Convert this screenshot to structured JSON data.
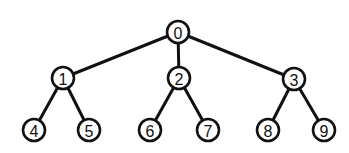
{
  "diagram": {
    "type": "tree",
    "colors": {
      "stroke": "#111111",
      "fill": "#ffffff",
      "text": "#111111"
    },
    "node_radius": 11,
    "nodes": [
      {
        "id": "0",
        "label": "0",
        "x": 178,
        "y": 32
      },
      {
        "id": "1",
        "label": "1",
        "x": 63,
        "y": 78
      },
      {
        "id": "2",
        "label": "2",
        "x": 179,
        "y": 78
      },
      {
        "id": "3",
        "label": "3",
        "x": 294,
        "y": 79
      },
      {
        "id": "4",
        "label": "4",
        "x": 34,
        "y": 130
      },
      {
        "id": "5",
        "label": "5",
        "x": 89,
        "y": 130
      },
      {
        "id": "6",
        "label": "6",
        "x": 150,
        "y": 130
      },
      {
        "id": "7",
        "label": "7",
        "x": 208,
        "y": 130
      },
      {
        "id": "8",
        "label": "8",
        "x": 268,
        "y": 130
      },
      {
        "id": "9",
        "label": "9",
        "x": 324,
        "y": 130
      }
    ],
    "edges": [
      {
        "from": "0",
        "to": "1"
      },
      {
        "from": "0",
        "to": "2"
      },
      {
        "from": "0",
        "to": "3"
      },
      {
        "from": "1",
        "to": "4"
      },
      {
        "from": "1",
        "to": "5"
      },
      {
        "from": "2",
        "to": "6"
      },
      {
        "from": "2",
        "to": "7"
      },
      {
        "from": "3",
        "to": "8"
      },
      {
        "from": "3",
        "to": "9"
      }
    ]
  }
}
